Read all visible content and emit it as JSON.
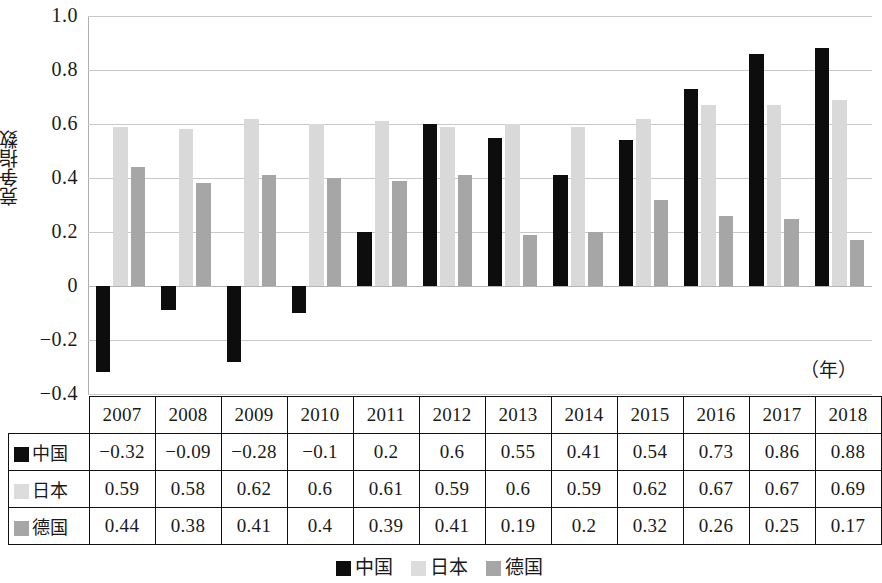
{
  "chart_data": {
    "type": "bar",
    "title": "",
    "xlabel": "（年）",
    "ylabel": "竞争指数",
    "ylim": [
      -0.4,
      1.0
    ],
    "yticks": [
      "1.0",
      "0.8",
      "0.6",
      "0.4",
      "0.2",
      "0",
      "−0.2",
      "−0.4"
    ],
    "ytick_values": [
      1.0,
      0.8,
      0.6,
      0.4,
      0.2,
      0,
      -0.2,
      -0.4
    ],
    "grid": true,
    "legend_position": "bottom",
    "categories": [
      "2007",
      "2008",
      "2009",
      "2010",
      "2011",
      "2012",
      "2013",
      "2014",
      "2015",
      "2016",
      "2017",
      "2018"
    ],
    "series": [
      {
        "name": "中国",
        "color": "#0d0d0d",
        "values": [
          -0.32,
          -0.09,
          -0.28,
          -0.1,
          0.2,
          0.6,
          0.55,
          0.41,
          0.54,
          0.73,
          0.86,
          0.88
        ],
        "labels": [
          "−0.32",
          "−0.09",
          "−0.28",
          "−0.1",
          "0.2",
          "0.6",
          "0.55",
          "0.41",
          "0.54",
          "0.73",
          "0.86",
          "0.88"
        ]
      },
      {
        "name": "日本",
        "color": "#d9d9d9",
        "values": [
          0.59,
          0.58,
          0.62,
          0.6,
          0.61,
          0.59,
          0.6,
          0.59,
          0.62,
          0.67,
          0.67,
          0.69
        ],
        "labels": [
          "0.59",
          "0.58",
          "0.62",
          "0.6",
          "0.61",
          "0.59",
          "0.6",
          "0.59",
          "0.62",
          "0.67",
          "0.67",
          "0.69"
        ]
      },
      {
        "name": "德国",
        "color": "#a6a6a6",
        "values": [
          0.44,
          0.38,
          0.41,
          0.4,
          0.39,
          0.41,
          0.19,
          0.2,
          0.32,
          0.26,
          0.25,
          0.17
        ],
        "labels": [
          "0.44",
          "0.38",
          "0.41",
          "0.4",
          "0.39",
          "0.41",
          "0.19",
          "0.2",
          "0.32",
          "0.26",
          "0.25",
          "0.17"
        ]
      }
    ]
  },
  "table": {
    "corner_label": "",
    "year_headers": [
      "2007",
      "2008",
      "2009",
      "2010",
      "2011",
      "2012",
      "2013",
      "2014",
      "2015",
      "2016",
      "2017",
      "2018"
    ],
    "rows": [
      {
        "label": "中国",
        "swatch": "cn",
        "cells": [
          "−0.32",
          "−0.09",
          "−0.28",
          "−0.1",
          "0.2",
          "0.6",
          "0.55",
          "0.41",
          "0.54",
          "0.73",
          "0.86",
          "0.88"
        ]
      },
      {
        "label": "日本",
        "swatch": "jp",
        "cells": [
          "0.59",
          "0.58",
          "0.62",
          "0.6",
          "0.61",
          "0.59",
          "0.6",
          "0.59",
          "0.62",
          "0.67",
          "0.67",
          "0.69"
        ]
      },
      {
        "label": "德国",
        "swatch": "de",
        "cells": [
          "0.44",
          "0.38",
          "0.41",
          "0.4",
          "0.39",
          "0.41",
          "0.19",
          "0.2",
          "0.32",
          "0.26",
          "0.25",
          "0.17"
        ]
      }
    ]
  },
  "legend": {
    "items": [
      {
        "label": "中国",
        "swatch": "cn"
      },
      {
        "label": "日本",
        "swatch": "jp"
      },
      {
        "label": "德国",
        "swatch": "de"
      }
    ]
  },
  "axis": {
    "unit_label": "（年）",
    "y_title": "竞争指数"
  }
}
